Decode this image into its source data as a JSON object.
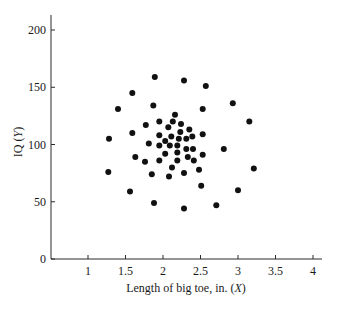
{
  "chart_data": {
    "type": "scatter",
    "title": "",
    "xlabel": "Length of big toe, in. (X)",
    "xlabel_parts": [
      "Length of big toe, in. (",
      "X",
      ")"
    ],
    "ylabel": "IQ (Y)",
    "ylabel_parts": [
      "IQ (",
      "Y",
      ")"
    ],
    "xlim": [
      0.5,
      4.15
    ],
    "ylim": [
      0,
      212
    ],
    "xticks": [
      1,
      1.5,
      2,
      2.5,
      3,
      3.5,
      4
    ],
    "xtick_labels": [
      "1",
      "1.5",
      "2",
      "2.5",
      "3",
      "3.5",
      "4"
    ],
    "yticks": [
      0,
      50,
      100,
      150,
      200
    ],
    "ytick_labels": [
      "0",
      "50",
      "100",
      "150",
      "200"
    ],
    "grid": false,
    "legend": null,
    "marker_color": "#111111",
    "series": [
      {
        "name": "observations",
        "points": [
          [
            1.89,
            159
          ],
          [
            2.28,
            156
          ],
          [
            2.57,
            151
          ],
          [
            1.59,
            145
          ],
          [
            1.4,
            131
          ],
          [
            1.87,
            134
          ],
          [
            2.93,
            136
          ],
          [
            2.53,
            131
          ],
          [
            2.16,
            126
          ],
          [
            1.77,
            117
          ],
          [
            1.95,
            120
          ],
          [
            2.13,
            120
          ],
          [
            2.24,
            118
          ],
          [
            2.07,
            115
          ],
          [
            3.15,
            120
          ],
          [
            1.59,
            110
          ],
          [
            1.95,
            108
          ],
          [
            2.11,
            107
          ],
          [
            2.23,
            111
          ],
          [
            2.35,
            113
          ],
          [
            2.39,
            107
          ],
          [
            2.53,
            109
          ],
          [
            1.28,
            105
          ],
          [
            2.21,
            105
          ],
          [
            2.31,
            105
          ],
          [
            1.81,
            101
          ],
          [
            2.03,
            103
          ],
          [
            1.95,
            99
          ],
          [
            2.09,
            99
          ],
          [
            2.19,
            99
          ],
          [
            2.31,
            96
          ],
          [
            2.4,
            96
          ],
          [
            2.81,
            96
          ],
          [
            1.63,
            89
          ],
          [
            2.03,
            92
          ],
          [
            2.19,
            93
          ],
          [
            2.53,
            91
          ],
          [
            1.76,
            85
          ],
          [
            1.95,
            86
          ],
          [
            2.19,
            86
          ],
          [
            2.33,
            89
          ],
          [
            2.41,
            86
          ],
          [
            1.27,
            76
          ],
          [
            2.12,
            80
          ],
          [
            2.48,
            78
          ],
          [
            3.21,
            79
          ],
          [
            1.85,
            74
          ],
          [
            2.08,
            72
          ],
          [
            2.28,
            75
          ],
          [
            1.56,
            59
          ],
          [
            2.51,
            64
          ],
          [
            3.0,
            60
          ],
          [
            1.88,
            49
          ],
          [
            2.28,
            44
          ],
          [
            2.71,
            47
          ]
        ]
      }
    ]
  }
}
